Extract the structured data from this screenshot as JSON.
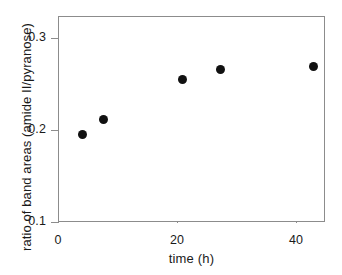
{
  "chart_data": {
    "type": "scatter",
    "title": "",
    "xlabel": "time (h)",
    "ylabel": "ratio of band areas (amide II/pyranose)",
    "xlim": [
      0,
      45
    ],
    "ylim": [
      0.1,
      0.312
    ],
    "xticks": [
      0,
      20,
      40
    ],
    "xtick_labels": [
      "0",
      "20",
      "40"
    ],
    "yticks": [
      0.1,
      0.2,
      0.3
    ],
    "ytick_labels": [
      "0.1",
      "0.2",
      "0.3"
    ],
    "grid": false,
    "legend": null,
    "series": [
      {
        "name": "amide II / pyranose ratio",
        "marker": "filled-circle",
        "color": "#111111",
        "points": [
          {
            "x": 3.9,
            "y": 0.196
          },
          {
            "x": 7.4,
            "y": 0.212
          },
          {
            "x": 20.7,
            "y": 0.256
          },
          {
            "x": 27.1,
            "y": 0.267
          },
          {
            "x": 42.7,
            "y": 0.27
          }
        ]
      }
    ],
    "x": [
      3.9,
      7.4,
      20.7,
      27.1,
      42.7
    ],
    "values": [
      0.196,
      0.212,
      0.256,
      0.267,
      0.27
    ],
    "axis_color": "#8c8c8c",
    "marker_color": "#111111",
    "background": "#ffffff"
  }
}
